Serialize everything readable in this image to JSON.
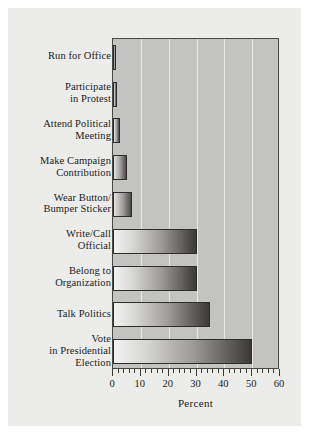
{
  "figure": {
    "background_color": "#ececeb",
    "plot_background_color": "#c3c3c1",
    "frame_color": "#4a4847",
    "gridline_color": "#e8e8e6",
    "text_color": "#201d1d"
  },
  "chart_data": {
    "type": "bar",
    "orientation": "horizontal",
    "title": "",
    "xlabel": "Percent",
    "ylabel": "",
    "xlim": [
      0,
      60
    ],
    "xticks": [
      0,
      10,
      20,
      30,
      40,
      50,
      60
    ],
    "xticklabels": [
      "0",
      "10",
      "20",
      "30",
      "40",
      "50",
      "60"
    ],
    "minor_tick_step": 2,
    "grid": true,
    "grid_axis": "x",
    "legend": null,
    "categories": [
      "Run for Office",
      "Participate in Protest",
      "Attend Political Meeting",
      "Make Campaign Contribution",
      "Wear Button/ Bumper Sticker",
      "Write/Call Official",
      "Belong to Organization",
      "Talk Politics",
      "Vote in Presidential Election"
    ],
    "values": [
      1,
      1.5,
      2.5,
      5,
      7,
      30,
      30,
      35,
      50
    ]
  },
  "labels": [
    {
      "lines": [
        "Run for Office"
      ],
      "value": 1
    },
    {
      "lines": [
        "Participate",
        "in Protest"
      ],
      "value": 1.5
    },
    {
      "lines": [
        "Attend Political",
        "Meeting"
      ],
      "value": 2.5
    },
    {
      "lines": [
        "Make Campaign",
        "Contribution"
      ],
      "value": 5
    },
    {
      "lines": [
        "Wear Button/",
        "Bumper Sticker"
      ],
      "value": 7
    },
    {
      "lines": [
        "Write/Call",
        "Official"
      ],
      "value": 30
    },
    {
      "lines": [
        "Belong to",
        "Organization"
      ],
      "value": 30
    },
    {
      "lines": [
        "Talk Politics"
      ],
      "value": 35
    },
    {
      "lines": [
        "Vote",
        "in Presidential",
        "Election"
      ],
      "value": 50
    }
  ],
  "axis": {
    "xlabel": "Percent",
    "tick_values": [
      "0",
      "10",
      "20",
      "30",
      "40",
      "50",
      "60"
    ]
  }
}
